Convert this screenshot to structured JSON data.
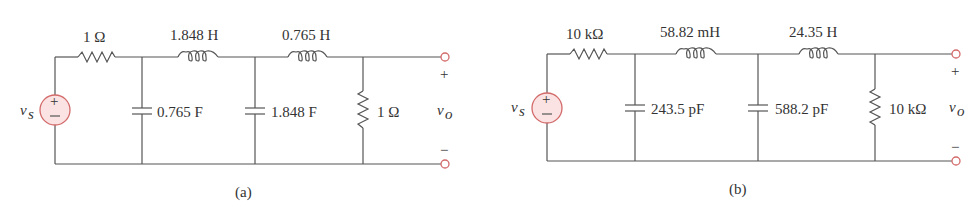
{
  "figure": {
    "circuit_a": {
      "caption": "(a)",
      "source_label": "v",
      "source_sub": "s",
      "output_label": "v",
      "output_sub": "o",
      "plus": "+",
      "minus": "−",
      "series_resistor": "1 Ω",
      "inductor_1": "1.848 H",
      "inductor_2": "0.765 H",
      "capacitor_1": "0.765 F",
      "capacitor_2": "1.848 F",
      "load_resistor": "1 Ω"
    },
    "circuit_b": {
      "caption": "(b)",
      "source_label": "v",
      "source_sub": "s",
      "output_label": "v",
      "output_sub": "o",
      "plus": "+",
      "minus": "−",
      "series_resistor": "10 kΩ",
      "inductor_1": "58.82 mH",
      "inductor_2": "24.35 H",
      "capacitor_1": "243.5 pF",
      "capacitor_2": "588.2 pF",
      "load_resistor": "10 kΩ"
    },
    "colors": {
      "wire": "#555555",
      "source_fill": "#fbe3e3",
      "source_stroke": "#d36a6a",
      "terminal_stroke": "#d36a6a"
    }
  }
}
